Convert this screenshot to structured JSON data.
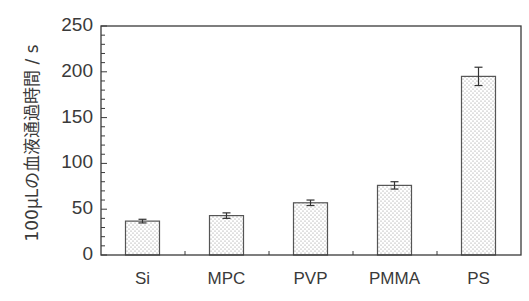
{
  "chart_data": {
    "type": "bar",
    "title": "",
    "xlabel": "",
    "ylabel": "100μLの血液通過時間 / s",
    "categories": [
      "Si",
      "MPC",
      "PVP",
      "PMMA",
      "PS"
    ],
    "values": [
      37,
      43,
      57,
      76,
      195
    ],
    "errors": [
      2,
      3,
      3,
      4,
      10
    ],
    "ylim": [
      0,
      250
    ],
    "yticks": [
      0,
      50,
      100,
      150,
      200,
      250
    ],
    "yminor_step": 10,
    "grid": false,
    "legend": null,
    "bar_fill": "dotted-pattern",
    "colors": {
      "axis": "#3a3a3a",
      "bar_edge": "#555555",
      "bar_dots": "#8a8a8a",
      "background": "#ffffff"
    }
  }
}
